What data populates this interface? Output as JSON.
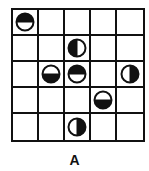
{
  "figure": {
    "label": "A",
    "grid": {
      "rows": 5,
      "cols": 5
    },
    "colors": {
      "line": "#111111",
      "fill": "#111111",
      "background": "#ffffff"
    },
    "discs": [
      {
        "row": 0,
        "col": 0,
        "filled_half": "top"
      },
      {
        "row": 1,
        "col": 2,
        "filled_half": "left"
      },
      {
        "row": 2,
        "col": 1,
        "filled_half": "bottom"
      },
      {
        "row": 2,
        "col": 2,
        "filled_half": "top"
      },
      {
        "row": 2,
        "col": 4,
        "filled_half": "right"
      },
      {
        "row": 3,
        "col": 3,
        "filled_half": "bottom"
      },
      {
        "row": 4,
        "col": 2,
        "filled_half": "right"
      }
    ]
  }
}
